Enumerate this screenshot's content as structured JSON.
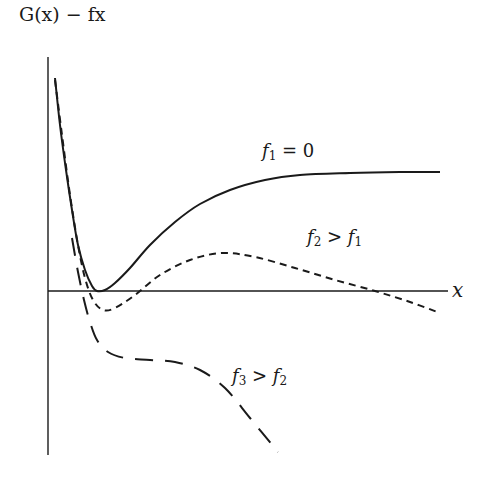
{
  "chart_data": {
    "type": "line",
    "title": "",
    "xlabel": "x",
    "ylabel": "G(x) − fx",
    "grid": false,
    "legend": "inline labels",
    "axes": {
      "y_axis": {
        "x": 48,
        "y_top": 57,
        "y_bottom": 455
      },
      "x_axis": {
        "y": 291,
        "x_left": 48,
        "x_right": 448
      }
    },
    "series": [
      {
        "name": "f1 = 0",
        "label_parts": {
          "f": "f",
          "sub": "1",
          "rel": " = ",
          "rhs": "0",
          "rhs_sub": ""
        },
        "style": "solid",
        "label_pos": {
          "x": 262,
          "y": 140
        },
        "points": [
          [
            55,
            78
          ],
          [
            60,
            125
          ],
          [
            66,
            170
          ],
          [
            72,
            210
          ],
          [
            78,
            245
          ],
          [
            85,
            270
          ],
          [
            92,
            286
          ],
          [
            97,
            291
          ],
          [
            105,
            290
          ],
          [
            115,
            283
          ],
          [
            130,
            268
          ],
          [
            150,
            245
          ],
          [
            175,
            222
          ],
          [
            200,
            204
          ],
          [
            230,
            190
          ],
          [
            265,
            180
          ],
          [
            300,
            175
          ],
          [
            350,
            173
          ],
          [
            400,
            172
          ],
          [
            440,
            172
          ]
        ]
      },
      {
        "name": "f2 > f1",
        "label_parts": {
          "f": "f",
          "sub": "2",
          "rel": " > ",
          "rhs": "f",
          "rhs_sub": "1"
        },
        "style": "short-dash",
        "label_pos": {
          "x": 307,
          "y": 226
        },
        "points": [
          [
            55,
            80
          ],
          [
            62,
            135
          ],
          [
            70,
            195
          ],
          [
            78,
            245
          ],
          [
            85,
            278
          ],
          [
            93,
            300
          ],
          [
            103,
            310
          ],
          [
            115,
            308
          ],
          [
            135,
            295
          ],
          [
            160,
            275
          ],
          [
            190,
            260
          ],
          [
            222,
            253
          ],
          [
            255,
            257
          ],
          [
            295,
            268
          ],
          [
            335,
            280
          ],
          [
            375,
            291
          ],
          [
            410,
            302
          ],
          [
            440,
            313
          ]
        ]
      },
      {
        "name": "f3 > f2",
        "label_parts": {
          "f": "f",
          "sub": "3",
          "rel": " > ",
          "rhs": "f",
          "rhs_sub": "2"
        },
        "style": "long-dash",
        "label_pos": {
          "x": 232,
          "y": 365
        },
        "points": [
          [
            72,
            238
          ],
          [
            78,
            272
          ],
          [
            84,
            300
          ],
          [
            90,
            322
          ],
          [
            97,
            340
          ],
          [
            108,
            352
          ],
          [
            125,
            358
          ],
          [
            150,
            360
          ],
          [
            175,
            362
          ],
          [
            200,
            370
          ],
          [
            225,
            388
          ],
          [
            250,
            418
          ],
          [
            278,
            452
          ]
        ]
      }
    ],
    "colors": {
      "line": "#1a1a1a",
      "background": "#ffffff"
    }
  }
}
